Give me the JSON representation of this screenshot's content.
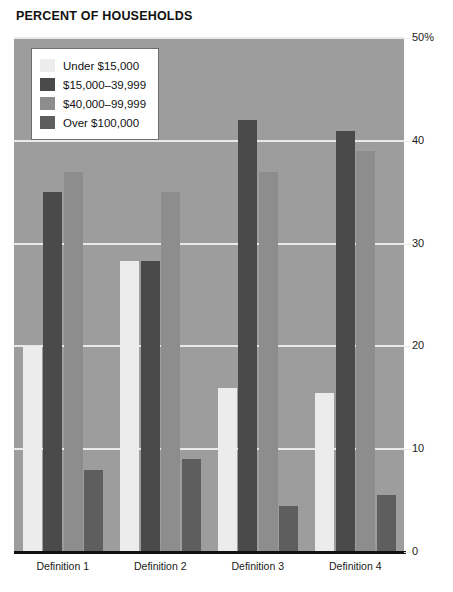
{
  "chart_data": {
    "type": "bar",
    "title": "PERCENT OF HOUSEHOLDS",
    "xlabel": "",
    "ylabel": "",
    "ylim": [
      0,
      50
    ],
    "yticks": [
      0,
      10,
      20,
      30,
      40,
      50
    ],
    "ytick_labels": [
      "0",
      "10",
      "20",
      "30",
      "40",
      "50%"
    ],
    "grid": true,
    "legend_position": "top-left",
    "categories": [
      "Definition 1",
      "Definition 2",
      "Definition 3",
      "Definition 4"
    ],
    "series": [
      {
        "name": "Under $15,000",
        "color": "#ececec",
        "values": [
          20.0,
          28.3,
          16.0,
          15.5
        ]
      },
      {
        "name": "$15,000–39,999",
        "color": "#4a4a4a",
        "values": [
          35.0,
          28.3,
          42.0,
          41.0
        ]
      },
      {
        "name": "$40,000–99,999",
        "color": "#8d8d8d",
        "values": [
          37.0,
          35.0,
          37.0,
          39.0
        ]
      },
      {
        "name": "Over $100,000",
        "color": "#5e5e5e",
        "values": [
          8.0,
          9.0,
          4.5,
          5.5
        ]
      }
    ]
  },
  "colors": {
    "plot_background": "#9d9d9d",
    "gridline": "#e9e9e9",
    "axis": "#111111",
    "page_background": "#ffffff",
    "text": "#121212"
  }
}
